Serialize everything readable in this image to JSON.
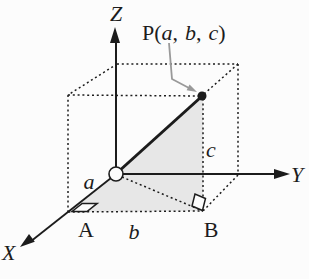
{
  "figure": {
    "bg": "#fcfcfc",
    "ink": "#1c1c1c",
    "shade": "#e7e7e7",
    "leader": "#999999",
    "labels": {
      "z_axis": "Z",
      "y_axis": "Y",
      "x_axis": "X",
      "edge_a": "a",
      "edge_b": "b",
      "edge_c": "c",
      "corner_A": "A",
      "corner_B": "B",
      "point": {
        "prefix": "P(",
        "a": "a",
        "sep1": ",",
        "b": "b",
        "sep2": ",",
        "c": "c",
        "suffix": ")"
      }
    }
  }
}
